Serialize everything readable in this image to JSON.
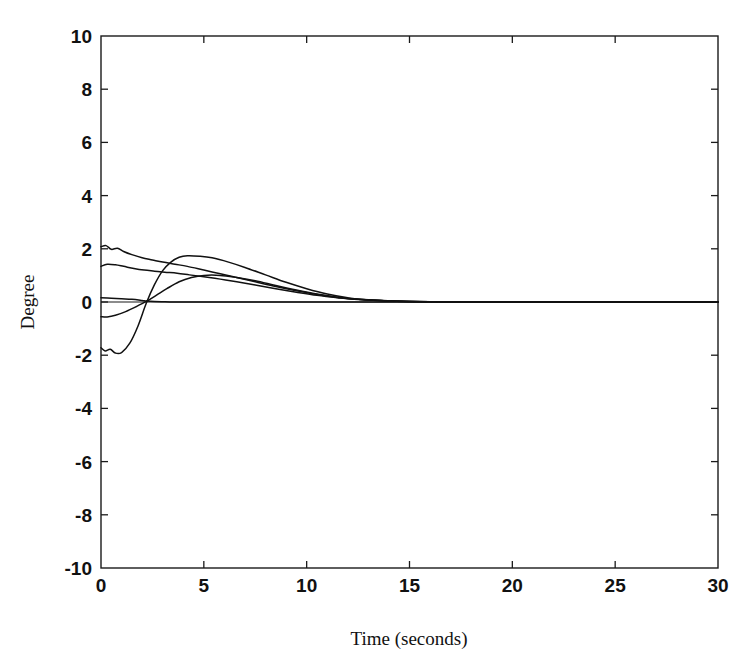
{
  "chart_data": {
    "type": "line",
    "title": "",
    "xlabel": "Time (seconds)",
    "ylabel": "Degree",
    "xlim": [
      0,
      30
    ],
    "ylim": [
      -10,
      10
    ],
    "xticks": [
      0,
      5,
      10,
      15,
      20,
      25,
      30
    ],
    "yticks": [
      -10,
      -8,
      -6,
      -4,
      -2,
      0,
      2,
      4,
      6,
      8,
      10
    ],
    "xtick_labels": [
      "0",
      "5",
      "10",
      "15",
      "20",
      "25",
      "30"
    ],
    "ytick_labels": [
      "-10",
      "-8",
      "-6",
      "-4",
      "-2",
      "0",
      "2",
      "4",
      "6",
      "8",
      "10"
    ],
    "grid": false,
    "legend": "none",
    "tick_direction": "in",
    "series": [
      {
        "name": "curve-1",
        "x": [
          0,
          0.25,
          0.5,
          0.8,
          1.1,
          1.5,
          2.0,
          2.5,
          3.0,
          3.6,
          4.2,
          5.0,
          5.8,
          6.6,
          7.5,
          8.5,
          9.5,
          10.5,
          11.5,
          12.5,
          14,
          16,
          18,
          20,
          24,
          30
        ],
        "values": [
          2.08,
          2.12,
          1.98,
          2.02,
          1.9,
          1.78,
          1.66,
          1.58,
          1.5,
          1.42,
          1.34,
          1.2,
          1.06,
          0.92,
          0.76,
          0.58,
          0.42,
          0.28,
          0.17,
          0.1,
          0.04,
          0.01,
          0.0,
          0.0,
          0.0,
          0.0
        ]
      },
      {
        "name": "curve-2",
        "x": [
          0,
          0.3,
          0.7,
          1.1,
          1.6,
          2.1,
          2.6,
          3.1,
          3.7,
          4.3,
          5.0,
          5.8,
          6.6,
          7.5,
          8.5,
          9.5,
          10.5,
          11.5,
          12.5,
          14,
          16,
          18,
          20,
          24,
          30
        ],
        "values": [
          1.34,
          1.42,
          1.4,
          1.34,
          1.26,
          1.2,
          1.16,
          1.12,
          1.08,
          1.02,
          0.95,
          0.86,
          0.76,
          0.64,
          0.5,
          0.37,
          0.25,
          0.16,
          0.09,
          0.04,
          0.01,
          0.0,
          0.0,
          0.0,
          0.0
        ]
      },
      {
        "name": "curve-3",
        "x": [
          0,
          0.5,
          1.0,
          1.5,
          2.0,
          2.2,
          2.6,
          3.0,
          3.5,
          4.0,
          4.5,
          5.0,
          5.8,
          6.6,
          7.5,
          8.5,
          9.5,
          10.5,
          11.5,
          12.5,
          14,
          16,
          18,
          20,
          24,
          30
        ],
        "values": [
          0.16,
          0.14,
          0.12,
          0.1,
          0.06,
          0.04,
          0.02,
          0.01,
          0.0,
          0.0,
          0.0,
          0.0,
          0.0,
          0.0,
          0.0,
          0.0,
          0.0,
          0.0,
          0.0,
          0.0,
          0.0,
          0.0,
          0.0,
          0.0,
          0.0,
          0.0
        ]
      },
      {
        "name": "curve-4",
        "x": [
          0,
          0.3,
          0.7,
          1.2,
          1.7,
          2.2,
          2.7,
          3.2,
          3.8,
          4.4,
          5.0,
          5.8,
          6.6,
          7.5,
          8.5,
          9.5,
          10.5,
          11.5,
          12.5,
          14,
          16,
          18,
          20,
          24,
          30
        ],
        "values": [
          -0.55,
          -0.56,
          -0.5,
          -0.36,
          -0.18,
          0.02,
          0.26,
          0.5,
          0.76,
          0.92,
          1.0,
          1.0,
          0.92,
          0.8,
          0.62,
          0.45,
          0.3,
          0.18,
          0.1,
          0.04,
          0.01,
          0.0,
          0.0,
          0.0,
          0.0
        ]
      },
      {
        "name": "curve-5",
        "x": [
          0,
          0.2,
          0.45,
          0.7,
          1.0,
          1.4,
          1.8,
          2.2,
          2.6,
          3.0,
          3.4,
          3.8,
          4.2,
          4.8,
          5.4,
          6.2,
          7.0,
          8.0,
          9.0,
          10.0,
          11.0,
          12.0,
          13.0,
          15,
          18,
          22,
          30
        ],
        "values": [
          -1.72,
          -1.84,
          -1.78,
          -1.92,
          -1.9,
          -1.55,
          -0.9,
          -0.05,
          0.65,
          1.18,
          1.5,
          1.68,
          1.74,
          1.72,
          1.66,
          1.5,
          1.3,
          1.02,
          0.74,
          0.5,
          0.3,
          0.16,
          0.08,
          0.02,
          0.0,
          0.0,
          0.0
        ]
      }
    ]
  },
  "figure": {
    "background_color": "#ffffff",
    "line_color": "#111111",
    "axis_color": "#1a1a1a"
  }
}
